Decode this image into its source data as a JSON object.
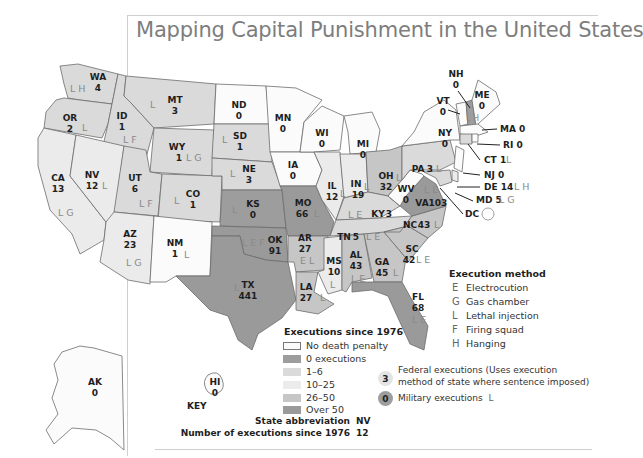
{
  "title": "Mapping Capital Punishment in the United States",
  "colors": {
    "no_death_penalty": "#fbfbfb",
    "zero_executions": "#9d9d9d",
    "range_1_6": "#dadada",
    "range_10_25": "#ebebeb",
    "range_26_50": "#c6c6c6",
    "over_50": "#9a9a9a",
    "border": "#6c6c6c",
    "title": "#7d7d7d"
  },
  "legend": {
    "executions_title": "Executions since 1976",
    "categories": [
      {
        "label": "No death penalty",
        "color": "#fbfbfb",
        "bordered": true
      },
      {
        "label": "0 executions",
        "color": "#9d9d9d"
      },
      {
        "label": "1–6",
        "color": "#dadada"
      },
      {
        "label": "10–25",
        "color": "#ebebeb"
      },
      {
        "label": "26–50",
        "color": "#c6c6c6"
      },
      {
        "label": "Over 50",
        "color": "#9a9a9a"
      }
    ],
    "method_title": "Execution method",
    "methods": [
      {
        "code": "E",
        "label": "Electrocution"
      },
      {
        "code": "G",
        "label": "Gas chamber"
      },
      {
        "code": "L",
        "label": "Lethal injection"
      },
      {
        "code": "F",
        "label": "Firing squad"
      },
      {
        "code": "H",
        "label": "Hanging"
      }
    ],
    "federal": {
      "count": "3",
      "line1": "Federal executions  (Uses execution",
      "line2": "method of state where sentence imposed)"
    },
    "military": {
      "count": "0",
      "label": "Military executions",
      "method": "L"
    },
    "key": {
      "title": "KEY",
      "abbr_label": "State abbreviation",
      "abbr_value": "NV",
      "count_label": "Number of executions since 1976",
      "count_value": "12"
    }
  },
  "states": {
    "WA": {
      "abbr": "WA",
      "count": "4",
      "methods": "L H"
    },
    "OR": {
      "abbr": "OR",
      "count": "2",
      "methods": "L"
    },
    "CA": {
      "abbr": "CA",
      "count": "13",
      "methods": "L G"
    },
    "ID": {
      "abbr": "ID",
      "count": "1",
      "methods": "L F"
    },
    "NV": {
      "abbr": "NV",
      "count": "12",
      "methods": "L"
    },
    "MT": {
      "abbr": "MT",
      "count": "3",
      "methods": "L"
    },
    "WY": {
      "abbr": "WY",
      "count": "1",
      "methods": "L G"
    },
    "UT": {
      "abbr": "UT",
      "count": "6",
      "methods": "L F"
    },
    "CO": {
      "abbr": "CO",
      "count": "1",
      "methods": "L"
    },
    "AZ": {
      "abbr": "AZ",
      "count": "23",
      "methods": "L G"
    },
    "NM": {
      "abbr": "NM",
      "count": "1",
      "methods": "L"
    },
    "ND": {
      "abbr": "ND",
      "count": "0",
      "methods": ""
    },
    "SD": {
      "abbr": "SD",
      "count": "1",
      "methods": "L"
    },
    "NE": {
      "abbr": "NE",
      "count": "3",
      "methods": "L"
    },
    "KS": {
      "abbr": "KS",
      "count": "0",
      "methods": "L"
    },
    "OK": {
      "abbr": "OK",
      "count": "91",
      "methods": "L E F"
    },
    "TX": {
      "abbr": "TX",
      "count": "441",
      "methods": "L"
    },
    "MN": {
      "abbr": "MN",
      "count": "0",
      "methods": ""
    },
    "IA": {
      "abbr": "IA",
      "count": "0",
      "methods": ""
    },
    "MO": {
      "abbr": "MO",
      "count": "66",
      "methods": "L"
    },
    "AR": {
      "abbr": "AR",
      "count": "27",
      "methods": "E L"
    },
    "LA": {
      "abbr": "LA",
      "count": "27",
      "methods": "L"
    },
    "WI": {
      "abbr": "WI",
      "count": "0",
      "methods": ""
    },
    "IL": {
      "abbr": "IL",
      "count": "12",
      "methods": "L"
    },
    "MI": {
      "abbr": "MI",
      "count": "0",
      "methods": ""
    },
    "IN": {
      "abbr": "IN",
      "count": "19",
      "methods": "L"
    },
    "OH": {
      "abbr": "OH",
      "count": "32",
      "methods": "L"
    },
    "KY": {
      "abbr": "KY",
      "count": "3",
      "methods": "L E"
    },
    "TN": {
      "abbr": "TN",
      "count": "5",
      "methods": "L E"
    },
    "MS": {
      "abbr": "MS",
      "count": "10",
      "methods": "L"
    },
    "AL": {
      "abbr": "AL",
      "count": "43",
      "methods": "L E"
    },
    "GA": {
      "abbr": "GA",
      "count": "45",
      "methods": "L"
    },
    "FL": {
      "abbr": "FL",
      "count": "68",
      "methods": "L E"
    },
    "SC": {
      "abbr": "SC",
      "count": "42",
      "methods": "L E"
    },
    "NC": {
      "abbr": "NC",
      "count": "43",
      "methods": "L"
    },
    "VA": {
      "abbr": "VA",
      "count": "103",
      "methods": "L E"
    },
    "WV": {
      "abbr": "WV",
      "count": "0",
      "methods": ""
    },
    "PA": {
      "abbr": "PA",
      "count": "3",
      "methods": "L"
    },
    "NY": {
      "abbr": "NY",
      "count": "0",
      "methods": ""
    },
    "VT": {
      "abbr": "VT",
      "count": "0",
      "methods": ""
    },
    "NH": {
      "abbr": "NH",
      "count": "0",
      "methods": "L H"
    },
    "ME": {
      "abbr": "ME",
      "count": "0",
      "methods": ""
    },
    "MA": {
      "abbr": "MA",
      "count": "0",
      "methods": ""
    },
    "RI": {
      "abbr": "RI",
      "count": "0",
      "methods": ""
    },
    "CT": {
      "abbr": "CT",
      "count": "1",
      "methods": "L"
    },
    "NJ": {
      "abbr": "NJ",
      "count": "0",
      "methods": ""
    },
    "DE": {
      "abbr": "DE",
      "count": "14",
      "methods": "L H"
    },
    "MD": {
      "abbr": "MD",
      "count": "5",
      "methods": "L G"
    },
    "DC": {
      "abbr": "DC",
      "count": "",
      "methods": ""
    },
    "AK": {
      "abbr": "AK",
      "count": "0",
      "methods": ""
    },
    "HI": {
      "abbr": "HI",
      "count": "0",
      "methods": ""
    }
  },
  "callouts": {
    "NH": "NH",
    "NH_count": "0",
    "VT": "VT",
    "VT_count": "0",
    "MA": "MA 0",
    "RI": "RI 0",
    "CT": "CT 1",
    "CT_m": "L",
    "NJ": "NJ 0",
    "DE": "DE 14",
    "DE_m": "L H",
    "MD": "MD 5",
    "MD_m": "L G",
    "DC": "DC"
  }
}
